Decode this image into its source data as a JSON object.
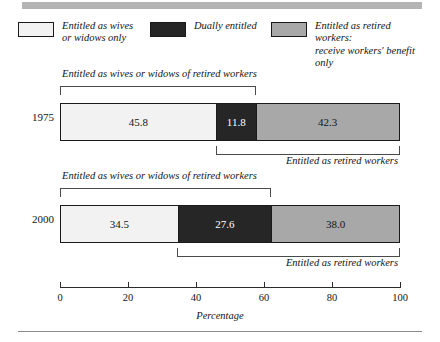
{
  "legend": {
    "items": [
      {
        "label": "Entitled as wives\nor widows only",
        "color": "#f2f2f2",
        "name": "legend-wives-or-widows-only"
      },
      {
        "label": "Dually entitled",
        "color": "#262626",
        "name": "legend-dually-entitled"
      },
      {
        "label": "Entitled as retired workers:\nreceive workers' benefit only",
        "color": "#a8a8a8",
        "name": "legend-retired-workers-only"
      }
    ]
  },
  "axis": {
    "title": "Percentage",
    "ticks": [
      "0",
      "20",
      "40",
      "60",
      "80",
      "100"
    ]
  },
  "annotations": {
    "r1975_top": "Entitled as wives or widows of retired workers",
    "r1975_bottom": "Entitled as retired workers",
    "r2000_top": "Entitled as wives or widows of retired workers",
    "r2000_bottom": "Entitled as retired workers"
  },
  "chart_data": {
    "type": "bar",
    "orientation": "horizontal",
    "stacked": true,
    "title": "",
    "xlabel": "Percentage",
    "ylabel": "",
    "xlim": [
      0,
      100
    ],
    "xticks": [
      0,
      20,
      40,
      60,
      80,
      100
    ],
    "grid": false,
    "legend_position": "top",
    "categories": [
      "1975",
      "2000"
    ],
    "series": [
      {
        "name": "Entitled as wives or widows only",
        "color": "#f2f2f2",
        "values": [
          45.8,
          34.5
        ],
        "labels": [
          "45.8",
          "34.5"
        ],
        "text_color": "#141414"
      },
      {
        "name": "Dually entitled",
        "color": "#262626",
        "values": [
          11.8,
          27.6
        ],
        "labels": [
          "11.8",
          "27.6"
        ],
        "text_color": "#ffffff"
      },
      {
        "name": "Entitled as retired workers: receive workers' benefit only",
        "color": "#a8a8a8",
        "values": [
          42.3,
          38.0
        ],
        "labels": [
          "42.3",
          "38.0"
        ],
        "text_color": "#141414"
      }
    ],
    "brackets": [
      {
        "category": "1975",
        "label": "Entitled as wives or widows of retired workers",
        "start": 0.0,
        "end": 57.6,
        "side": "top"
      },
      {
        "category": "1975",
        "label": "Entitled as retired workers",
        "start": 45.8,
        "end": 100.0,
        "side": "bottom"
      },
      {
        "category": "2000",
        "label": "Entitled as wives or widows of retired workers",
        "start": 0.0,
        "end": 62.1,
        "side": "top"
      },
      {
        "category": "2000",
        "label": "Entitled as retired workers",
        "start": 34.5,
        "end": 100.0,
        "side": "bottom"
      }
    ]
  }
}
